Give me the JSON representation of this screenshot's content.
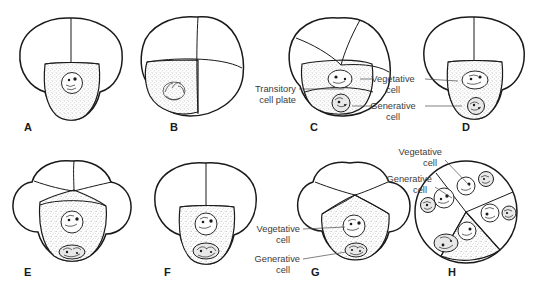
{
  "figure": {
    "background_color": "#ffffff",
    "line_color": "#1a1a1a",
    "label_color": "#3b3b3b",
    "stipple_color": "#9a9a9a"
  },
  "panels": [
    {
      "id": "A",
      "letter": "A",
      "letter_x": 24,
      "letter_y": 127,
      "center_x": 70,
      "center_y": 63,
      "description": "Three-lobed cell with one shaded basal cell containing a single nucleus",
      "nuclei": 1
    },
    {
      "id": "B",
      "letter": "B",
      "letter_x": 170,
      "letter_y": 127,
      "center_x": 196,
      "center_y": 60,
      "description": "Rotated grain with shaded lower-left cell containing condensed chromosomes",
      "nuclei": 1
    },
    {
      "id": "C",
      "letter": "C",
      "letter_x": 310,
      "letter_y": 127,
      "center_x": 340,
      "center_y": 63,
      "description": "Grain with shaded cell containing vegetative and generative nuclei separated by a transitory cell plate",
      "nuclei": 2
    },
    {
      "id": "D",
      "letter": "D",
      "letter_x": 462,
      "letter_y": 127,
      "center_x": 472,
      "center_y": 63,
      "description": "Three-lobed grain with shaded basal cell holding vegetative and generative nuclei",
      "nuclei": 2
    },
    {
      "id": "E",
      "letter": "E",
      "letter_x": 24,
      "letter_y": 272,
      "center_x": 72,
      "center_y": 210,
      "description": "Four-lobed grain with shaded basal cell, vegetative nucleus above generative nucleus",
      "nuclei": 2
    },
    {
      "id": "F",
      "letter": "F",
      "letter_x": 164,
      "letter_y": 272,
      "center_x": 205,
      "center_y": 210,
      "description": "Three-lobed grain with shaded basal cell containing vegetative and lobed generative nuclei",
      "nuclei": 2
    },
    {
      "id": "G",
      "letter": "G",
      "letter_x": 311,
      "letter_y": 272,
      "center_x": 350,
      "center_y": 210,
      "description": "Four-lobed grain with shaded wedge cell containing vegetative and generative nuclei",
      "nuclei": 2
    },
    {
      "id": "H",
      "letter": "H",
      "letter_x": 448,
      "letter_y": 272,
      "center_x": 455,
      "center_y": 210,
      "description": "Mature grain divided into four wedge cells each with a vegetative and a generative nucleus",
      "nuclei": 8
    }
  ],
  "callouts": [
    {
      "id": "transitory-cell-plate",
      "lines": [
        "Transitory",
        "cell plate"
      ],
      "text_anchor": "end",
      "x": 296,
      "y": 92,
      "line_height": 11,
      "target_panel": "C"
    },
    {
      "id": "vegetative-cell-cd",
      "lines": [
        "Vegetative",
        "cell"
      ],
      "text_anchor": "middle",
      "x": 398,
      "y": 82,
      "line_height": 11,
      "target_panel": "C and D"
    },
    {
      "id": "generative-cell-cd",
      "lines": [
        "Generative",
        "cell"
      ],
      "text_anchor": "middle",
      "x": 398,
      "y": 109,
      "line_height": 11,
      "target_panel": "C and D"
    },
    {
      "id": "vegetative-cell-g",
      "lines": [
        "Vegetative",
        "cell"
      ],
      "text_anchor": "end",
      "x": 300,
      "y": 232,
      "line_height": 11,
      "target_panel": "G"
    },
    {
      "id": "generative-cell-g",
      "lines": [
        "Generative",
        "cell"
      ],
      "text_anchor": "end",
      "x": 300,
      "y": 262,
      "line_height": 11,
      "target_panel": "G"
    },
    {
      "id": "vegetative-cell-h",
      "lines": [
        "Vegetative",
        "cell"
      ],
      "text_anchor": "end",
      "x": 442,
      "y": 155,
      "line_height": 11,
      "target_panel": "H"
    },
    {
      "id": "generative-cell-h",
      "lines": [
        "Generative",
        "cell"
      ],
      "text_anchor": "end",
      "x": 432,
      "y": 182,
      "line_height": 11,
      "target_panel": "H"
    }
  ]
}
